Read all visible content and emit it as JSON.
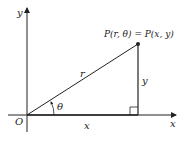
{
  "diagram": {
    "axes": {
      "x_label": "x",
      "y_label": "y",
      "origin_label": "O"
    },
    "point": {
      "label": "P(r, θ) = P(x, y)"
    },
    "segments": {
      "radius_label": "r",
      "vertical_label": "y",
      "horizontal_label": "x",
      "angle_label": "θ"
    },
    "colors": {
      "stroke": "#222222",
      "background": "#ffffff"
    }
  }
}
